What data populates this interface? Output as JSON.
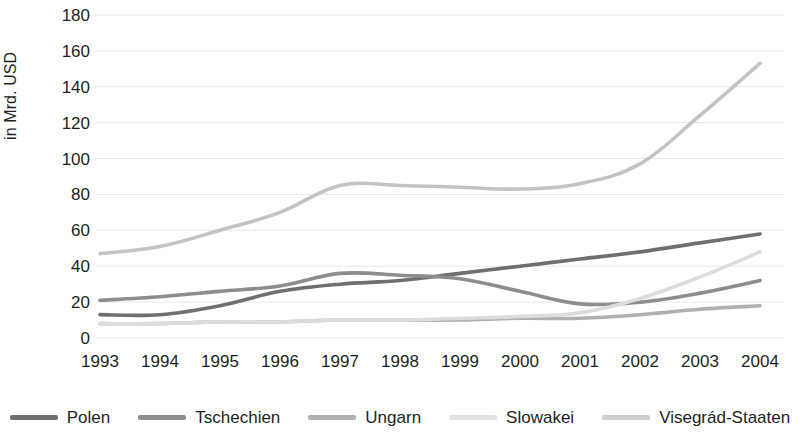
{
  "chart_data": {
    "type": "line",
    "title": "",
    "subtitle": "",
    "xlabel": "",
    "ylabel": "in Mrd. USD",
    "x": [
      "1993",
      "1994",
      "1995",
      "1996",
      "1997",
      "1998",
      "1999",
      "2000",
      "2001",
      "2002",
      "2003",
      "2004"
    ],
    "categories": [
      "1993",
      "1994",
      "1995",
      "1996",
      "1997",
      "1998",
      "1999",
      "2000",
      "2001",
      "2002",
      "2003",
      "2004"
    ],
    "xlim": [
      1993,
      2004
    ],
    "ylim": [
      0,
      180
    ],
    "yticks": [
      0,
      20,
      40,
      60,
      80,
      100,
      120,
      140,
      160,
      180
    ],
    "ytick_labels": [
      "0",
      "20",
      "40",
      "60",
      "80",
      "100",
      "120",
      "140",
      "160",
      "180"
    ],
    "grid": true,
    "grid_axis": "y",
    "legend_position": "bottom",
    "series": [
      {
        "name": "Polen",
        "color": "#6f6f6f",
        "values": [
          13,
          13,
          18,
          26,
          30,
          32,
          36,
          40,
          44,
          48,
          53,
          58
        ]
      },
      {
        "name": "Tschechien",
        "color": "#8d8d8d",
        "values": [
          21,
          23,
          26,
          29,
          36,
          35,
          33,
          26,
          19,
          20,
          25,
          32
        ]
      },
      {
        "name": "Ungarn",
        "color": "#b0b0b0",
        "values": [
          8,
          8,
          9,
          9,
          10,
          10,
          10,
          11,
          11,
          13,
          16,
          18
        ]
      },
      {
        "name": "Slowakei",
        "color": "#dcdcdc",
        "values": [
          8,
          8,
          9,
          9,
          10,
          10,
          11,
          12,
          14,
          22,
          34,
          48
        ]
      },
      {
        "name": "Visegrád-Staaten",
        "color": "#c3c3c3",
        "values": [
          47,
          51,
          60,
          70,
          85,
          85,
          84,
          83,
          86,
          97,
          124,
          153
        ]
      }
    ],
    "annotations": []
  },
  "legend": {
    "items": [
      {
        "label": "Polen",
        "color": "#6f6f6f"
      },
      {
        "label": "Tschechien",
        "color": "#8d8d8d"
      },
      {
        "label": "Ungarn",
        "color": "#b0b0b0"
      },
      {
        "label": "Slowakei",
        "color": "#e2e2e2"
      },
      {
        "label": "Visegrád-Staaten",
        "color": "#cfcfcf"
      }
    ]
  },
  "axes": {
    "y_title": "in Mrd. USD",
    "y_labels": [
      "180",
      "160",
      "140",
      "120",
      "100",
      "80",
      "60",
      "40",
      "20",
      "0"
    ],
    "x_labels": [
      "1993",
      "1994",
      "1995",
      "1996",
      "1997",
      "1998",
      "1999",
      "2000",
      "2001",
      "2002",
      "2003",
      "2004"
    ]
  },
  "colors": {
    "text": "#231f20",
    "grid": "#e8e8e8",
    "background": "#ffffff"
  }
}
